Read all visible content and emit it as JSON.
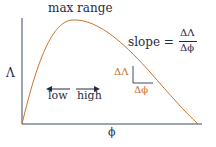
{
  "diagram": {
    "title_label": "max range",
    "y_axis_label": "Λ",
    "x_axis_label": "ϕ",
    "slope_equation": {
      "prefix": "slope =",
      "numerator": "ΔΛ",
      "denominator": "Δϕ"
    },
    "triangle_labels": {
      "vertical": "ΔΛ",
      "horizontal": "Δϕ"
    },
    "direction_labels": {
      "left": "low",
      "right": "high"
    },
    "colors": {
      "axis": "#3a4a66",
      "curve": "#c8742c",
      "text": "#1f2a44",
      "triangle_text": "#c8742c",
      "arrows": "#1f2a44"
    }
  }
}
